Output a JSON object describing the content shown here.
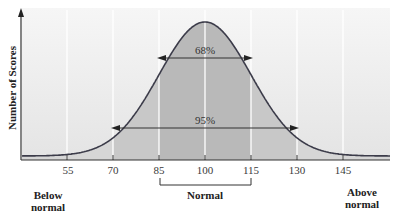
{
  "chart_data": {
    "type": "area",
    "title": "",
    "xlabel": "",
    "ylabel": "Number of Scores",
    "distribution": "normal",
    "mean": 100,
    "sd": 15,
    "x_ticks": [
      55,
      70,
      85,
      100,
      115,
      130,
      145
    ],
    "grid": true,
    "annotations": [
      {
        "label": "68%",
        "from": 85,
        "to": 115
      },
      {
        "label": "95%",
        "from": 70,
        "to": 130
      }
    ],
    "regions": [
      {
        "label": "Below normal",
        "position": "left"
      },
      {
        "label": "Normal",
        "from": 85,
        "to": 115
      },
      {
        "label": "Above normal",
        "position": "right"
      }
    ]
  },
  "labels": {
    "ylabel": "Number of Scores",
    "pct68": "68%",
    "pct95": "95%",
    "ticks": [
      "55",
      "70",
      "85",
      "100",
      "115",
      "130",
      "145"
    ],
    "below_line1": "Below",
    "below_line2": "normal",
    "normal": "Normal",
    "above_line1": "Above",
    "above_line2": "normal"
  },
  "colors": {
    "background_panel": "#ececec",
    "fill_outer": "#d6d6d6",
    "fill_95": "#c8c8c8",
    "fill_68": "#b9b9b9",
    "curve": "#3c3c4a",
    "gridline": "#ffffff"
  }
}
